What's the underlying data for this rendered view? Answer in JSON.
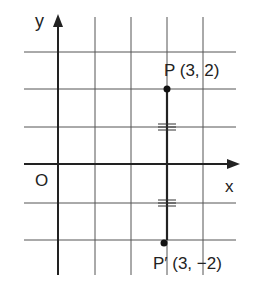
{
  "diagram": {
    "type": "coordinate-plane-reflection",
    "axes": {
      "x_label": "x",
      "y_label": "y",
      "origin_label": "O"
    },
    "grid": {
      "x_range": [
        -1,
        4
      ],
      "y_range": [
        -2,
        3
      ]
    },
    "points": [
      {
        "name": "P",
        "label": "P (3, 2)",
        "x": 3,
        "y": 2
      },
      {
        "name": "P'",
        "label": "P′ (3, −2)",
        "x": 3,
        "y": -2
      }
    ],
    "segment": {
      "from": "P",
      "to": "P'",
      "equal_marks": "double tick on each half"
    },
    "colors": {
      "line": "#333333",
      "grid": "#444444",
      "background": "#ffffff"
    }
  }
}
